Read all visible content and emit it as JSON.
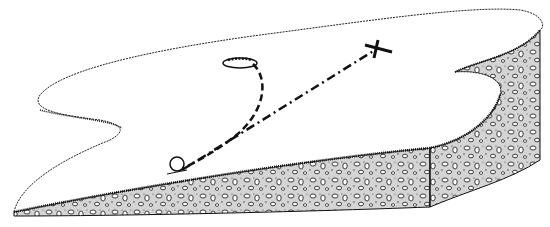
{
  "figure": {
    "colors": {
      "ink": "#111111",
      "background": "#ffffff",
      "soil_fill": "#dcdcdc"
    },
    "elements": {
      "ball": "golf-ball",
      "hole": "cup-hole",
      "target": "aim-point-x",
      "putt_path": "curved-dashed-line",
      "aim_line": "straight-dash-dot-line",
      "green_surface": "green-top",
      "soil_edge": "cross-section-soil"
    }
  }
}
